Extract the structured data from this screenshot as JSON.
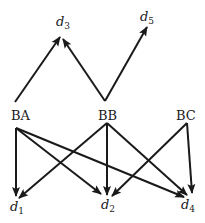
{
  "diagram": {
    "type": "directed-graph",
    "nodes": [
      {
        "id": "BA",
        "label": "BA",
        "x": 22,
        "y": 146
      },
      {
        "id": "BB",
        "label": "BB",
        "x": 107,
        "y": 146
      },
      {
        "id": "BC",
        "label": "BC",
        "x": 187,
        "y": 146
      },
      {
        "id": "d1",
        "label": "d",
        "sub": "1",
        "x": 15,
        "y": 210
      },
      {
        "id": "d2",
        "label": "d",
        "sub": "2",
        "x": 104,
        "y": 210
      },
      {
        "id": "d3",
        "label": "d",
        "sub": "3",
        "x": 60,
        "y": 25
      },
      {
        "id": "d4",
        "label": "d",
        "sub": "4",
        "x": 186,
        "y": 210
      },
      {
        "id": "d5",
        "label": "d",
        "sub": "5",
        "x": 145,
        "y": 22
      }
    ],
    "edges": [
      {
        "from": "BA",
        "to": "d3",
        "x1": 15,
        "y1": 102,
        "x2": 60,
        "y2": 37
      },
      {
        "from": "BB",
        "to": "d3",
        "x1": 105,
        "y1": 101,
        "x2": 63,
        "y2": 39
      },
      {
        "from": "BB",
        "to": "d5",
        "x1": 105,
        "y1": 101,
        "x2": 147,
        "y2": 27
      },
      {
        "from": "BA",
        "to": "d1",
        "x1": 16,
        "y1": 128,
        "x2": 16,
        "y2": 196
      },
      {
        "from": "BA",
        "to": "d2",
        "x1": 16,
        "y1": 128,
        "x2": 101,
        "y2": 194
      },
      {
        "from": "BA",
        "to": "d4",
        "x1": 16,
        "y1": 128,
        "x2": 184,
        "y2": 197
      },
      {
        "from": "BB",
        "to": "d1",
        "x1": 107,
        "y1": 123,
        "x2": 19,
        "y2": 198
      },
      {
        "from": "BB",
        "to": "d2",
        "x1": 107,
        "y1": 123,
        "x2": 107,
        "y2": 195
      },
      {
        "from": "BB",
        "to": "d4",
        "x1": 107,
        "y1": 123,
        "x2": 187,
        "y2": 195
      },
      {
        "from": "BC",
        "to": "d2",
        "x1": 187,
        "y1": 123,
        "x2": 112,
        "y2": 196
      },
      {
        "from": "BC",
        "to": "d4",
        "x1": 187,
        "y1": 123,
        "x2": 192,
        "y2": 193
      }
    ]
  },
  "labels": {
    "BA": "BA",
    "BB": "BB",
    "BC": "BC",
    "d": "d",
    "s1": "1",
    "s2": "2",
    "s3": "3",
    "s4": "4",
    "s5": "5"
  }
}
